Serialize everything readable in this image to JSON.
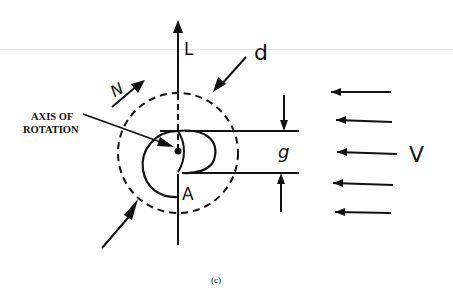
{
  "figure": {
    "caption": "(c)",
    "labels": {
      "lift": "L",
      "diameter": "d",
      "rotation_speed": "N",
      "axis": [
        "AXIS OF",
        "ROTATION"
      ],
      "gap": "g",
      "point": "A",
      "wind_velocity": "V"
    },
    "colors": {
      "ink": "#111111",
      "background": "#ffffff"
    },
    "wind_arrow_count": 5
  }
}
